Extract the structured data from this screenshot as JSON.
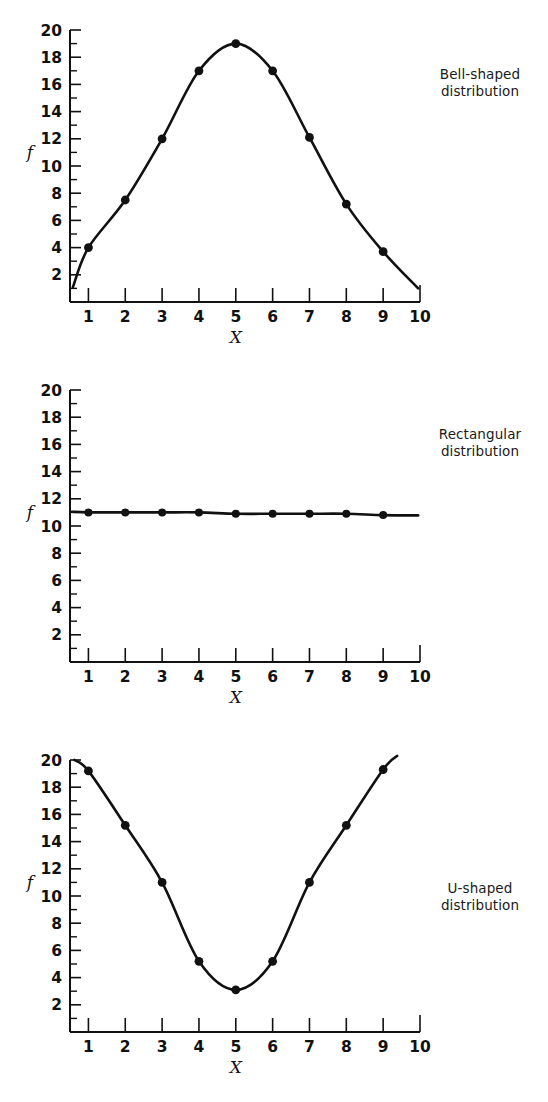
{
  "page": {
    "background": "#ffffff",
    "ink": "#111111",
    "panel_count": 3
  },
  "charts": [
    {
      "id": "bell",
      "label_line1": "Bell-shaped",
      "label_line2": "distribution",
      "chart_data": {
        "type": "line",
        "title": "Bell-shaped distribution",
        "xlabel": "X",
        "ylabel": "f",
        "x": [
          1,
          2,
          3,
          4,
          5,
          6,
          7,
          8,
          9
        ],
        "values": [
          4.0,
          7.5,
          12.0,
          17.0,
          19.0,
          17.0,
          12.1,
          7.2,
          3.7
        ],
        "xlim": [
          0.5,
          10
        ],
        "ylim": [
          0,
          20
        ],
        "xticks": [
          1,
          2,
          3,
          4,
          5,
          6,
          7,
          8,
          9,
          10
        ],
        "xticklabels": [
          "1",
          "2",
          "3",
          "4",
          "5",
          "6",
          "7",
          "8",
          "9",
          "10"
        ],
        "yticks": [
          2,
          4,
          6,
          8,
          10,
          12,
          14,
          16,
          18,
          20
        ],
        "yticklabels": [
          "2",
          "4",
          "6",
          "8",
          "10",
          "12",
          "14",
          "16",
          "18",
          "20"
        ],
        "yminorticks": [
          1,
          3,
          5,
          7,
          9,
          11,
          13,
          15,
          17,
          19
        ],
        "grid": false,
        "legend": "none",
        "markers": true
      }
    },
    {
      "id": "rectangular",
      "label_line1": "Rectangular",
      "label_line2": "distribution",
      "chart_data": {
        "type": "line",
        "title": "Rectangular distribution",
        "xlabel": "X",
        "ylabel": "f",
        "x": [
          1,
          2,
          3,
          4,
          5,
          6,
          7,
          8,
          9
        ],
        "values": [
          11.0,
          11.0,
          11.0,
          11.0,
          10.9,
          10.9,
          10.9,
          10.9,
          10.8
        ],
        "xlim": [
          0.5,
          10
        ],
        "ylim": [
          0,
          20
        ],
        "xticks": [
          1,
          2,
          3,
          4,
          5,
          6,
          7,
          8,
          9,
          10
        ],
        "xticklabels": [
          "1",
          "2",
          "3",
          "4",
          "5",
          "6",
          "7",
          "8",
          "9",
          "10"
        ],
        "yticks": [
          2,
          4,
          6,
          8,
          10,
          12,
          14,
          16,
          18,
          20
        ],
        "yticklabels": [
          "2",
          "4",
          "6",
          "8",
          "10",
          "12",
          "14",
          "16",
          "18",
          "20"
        ],
        "yminorticks": [
          1,
          3,
          5,
          7,
          9,
          11,
          13,
          15,
          17,
          19
        ],
        "grid": false,
        "legend": "none",
        "markers": true
      }
    },
    {
      "id": "u-shaped",
      "label_line1": "U-shaped",
      "label_line2": "distribution",
      "chart_data": {
        "type": "line",
        "title": "U-shaped distribution",
        "xlabel": "X",
        "ylabel": "f",
        "x": [
          1,
          2,
          3,
          4,
          5,
          6,
          7,
          8,
          9
        ],
        "values": [
          19.2,
          15.2,
          11.0,
          5.2,
          3.1,
          5.2,
          11.0,
          15.2,
          19.3
        ],
        "xlim": [
          0.5,
          10
        ],
        "ylim": [
          0,
          20
        ],
        "xticks": [
          1,
          2,
          3,
          4,
          5,
          6,
          7,
          8,
          9,
          10
        ],
        "xticklabels": [
          "1",
          "2",
          "3",
          "4",
          "5",
          "6",
          "7",
          "8",
          "9",
          "10"
        ],
        "yticks": [
          2,
          4,
          6,
          8,
          10,
          12,
          14,
          16,
          18,
          20
        ],
        "yticklabels": [
          "2",
          "4",
          "6",
          "8",
          "10",
          "12",
          "14",
          "16",
          "18",
          "20"
        ],
        "yminorticks": [
          1,
          3,
          5,
          7,
          9,
          11,
          13,
          15,
          17,
          19
        ],
        "grid": false,
        "legend": "none",
        "markers": true
      }
    }
  ]
}
